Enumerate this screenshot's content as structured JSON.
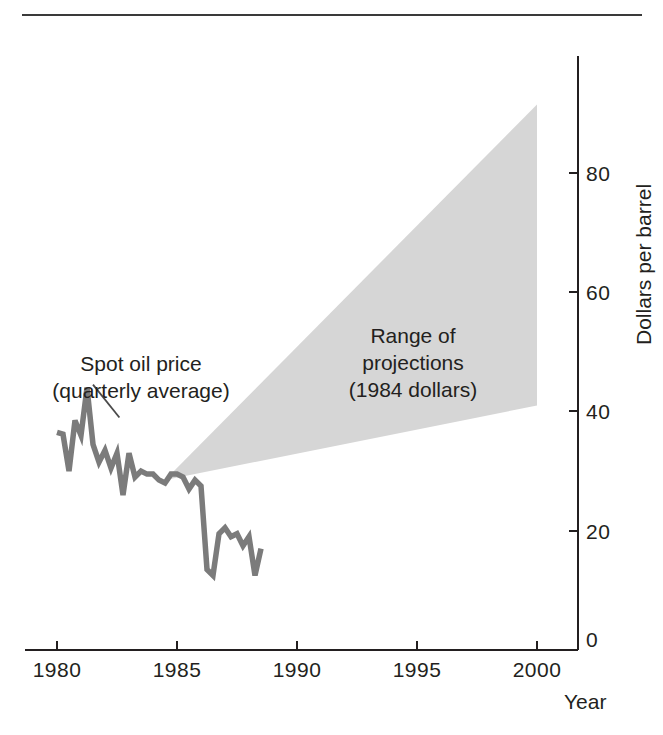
{
  "figure": {
    "top_rule": "horizontal-rule"
  },
  "chart_data": {
    "type": "line",
    "title": "",
    "subtitle": "",
    "xlabel": "Year",
    "ylabel": "Dollars per barrel",
    "xlim": [
      1979.2,
      2001.9
    ],
    "ylim": [
      0,
      96
    ],
    "xticks": [
      1980,
      1985,
      1990,
      1995,
      2000
    ],
    "xtick_labels": [
      "1980",
      "1985",
      "1990",
      "1995",
      "2000"
    ],
    "yticks": [
      0,
      20,
      40,
      60,
      80
    ],
    "ytick_labels": [
      "0",
      "20",
      "40",
      "60",
      "80"
    ],
    "grid": false,
    "legend_position": "none",
    "series": [
      {
        "name": "Spot oil price (quarterly average)",
        "type": "line",
        "color": "#7b7b7b",
        "x": [
          1980.0,
          1980.25,
          1980.5,
          1980.75,
          1981.0,
          1981.25,
          1981.5,
          1981.75,
          1982.0,
          1982.25,
          1982.5,
          1982.75,
          1983.0,
          1983.25,
          1983.5,
          1983.75,
          1984.0,
          1984.25,
          1984.5,
          1984.75,
          1985.0,
          1985.25,
          1985.5,
          1985.75,
          1986.0,
          1986.25,
          1986.5,
          1986.75,
          1987.0,
          1987.25,
          1987.5,
          1987.75,
          1988.0,
          1988.25,
          1988.5
        ],
        "y": [
          36.5,
          36.2,
          30.0,
          38.5,
          36.0,
          44.0,
          34.5,
          31.5,
          33.5,
          30.5,
          33.0,
          26.0,
          33.0,
          29.0,
          30.0,
          29.5,
          29.5,
          28.5,
          28.0,
          29.5,
          29.5,
          29.0,
          27.0,
          28.5,
          27.5,
          13.5,
          12.5,
          19.5,
          20.5,
          19.0,
          19.5,
          17.5,
          19.0,
          12.5,
          17.0
        ]
      },
      {
        "name": "Range of projections (1984 dollars) — upper bound",
        "type": "band-upper",
        "color": "#d6d6d6",
        "x": [
          1984.5,
          2000.0
        ],
        "y": [
          28.5,
          91.5
        ]
      },
      {
        "name": "Range of projections (1984 dollars) — lower bound",
        "type": "band-lower",
        "color": "#d6d6d6",
        "x": [
          1984.5,
          2000.0
        ],
        "y": [
          28.5,
          41.0
        ]
      }
    ],
    "annotations": [
      {
        "id": "spot-oil-price",
        "text_lines": [
          "Spot oil price",
          "(quarterly average)"
        ],
        "leader_from": [
          1982.6,
          39.0
        ],
        "leader_to": [
          1981.5,
          44.5
        ]
      },
      {
        "id": "range-of-projections",
        "text_lines": [
          "Range of",
          "projections",
          "(1984 dollars)"
        ],
        "anchor": [
          1994.0,
          55.0
        ]
      }
    ]
  },
  "labels": {
    "x_axis_title": "Year",
    "y_axis_title": "Dollars per barrel",
    "x_ticks": [
      "1980",
      "1985",
      "1990",
      "1995",
      "2000"
    ],
    "y_ticks": [
      "0",
      "20",
      "40",
      "60",
      "80"
    ],
    "annotation_spot_line1": "Spot oil price",
    "annotation_spot_line2": "(quarterly average)",
    "annotation_range_line1": "Range of",
    "annotation_range_line2": "projections",
    "annotation_range_line3": "(1984 dollars)"
  },
  "colors": {
    "series_line": "#7b7b7b",
    "band_fill": "#d6d6d6",
    "axis": "#231f20",
    "background": "#ffffff"
  }
}
